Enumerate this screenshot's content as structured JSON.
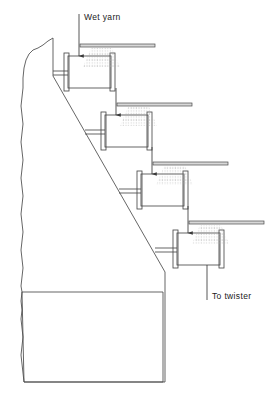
{
  "figure": {
    "line_color": "#4a4a4a",
    "spray_color": "#9a9a9a",
    "text_color": "#1a1a1a",
    "background": "#ffffff",
    "width": 272,
    "height": 394
  },
  "labels": {
    "inlet": "Wet yarn",
    "outlet": "To twister"
  },
  "rollers": [
    {
      "id": 1,
      "drum_x": 68,
      "drum_y": 56,
      "drum_w": 43,
      "drum_h": 32
    },
    {
      "id": 2,
      "drum_x": 105,
      "drum_y": 115,
      "drum_w": 43,
      "drum_h": 32
    },
    {
      "id": 3,
      "drum_x": 141,
      "drum_y": 174,
      "drum_w": 43,
      "drum_h": 32
    },
    {
      "id": 4,
      "drum_x": 177,
      "drum_y": 233,
      "drum_w": 43,
      "drum_h": 32
    }
  ],
  "spray_bars": [
    {
      "id": 1,
      "x": 80,
      "y": 44,
      "w": 75,
      "h": 3
    },
    {
      "id": 2,
      "x": 117,
      "y": 103,
      "w": 75,
      "h": 3
    },
    {
      "id": 3,
      "x": 153,
      "y": 162,
      "w": 75,
      "h": 3
    },
    {
      "id": 4,
      "x": 189,
      "y": 221,
      "w": 75,
      "h": 3
    }
  ],
  "yarn_path": {
    "inlet_x": 79,
    "inlet_top_y": 14,
    "outlet_x": 207,
    "outlet_bottom_y": 300,
    "description": "Wet yarn enters vertically at top, passes over four staggered spray rollers, exits to twister"
  },
  "frame": {
    "top_corner_x": 53,
    "top_corner_y": 38,
    "diagonal_end_x": 165,
    "diagonal_end_y": 270,
    "base_box_top_y": 292,
    "base_box_bottom_y": 382,
    "base_box_right_x": 163
  }
}
